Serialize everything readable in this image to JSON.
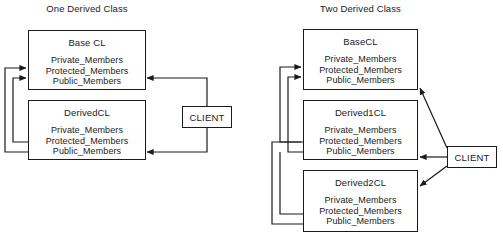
{
  "diagram": {
    "type": "uml-inheritance-diagram",
    "background_color": "#ffffff",
    "line_color": "#1a1a1a",
    "text_color": "#1a1a1a",
    "members": {
      "private": "Private_Members",
      "protected": "Protected_Members",
      "public": "Public_Members"
    },
    "panels": [
      {
        "id": "one-derived-class",
        "title": "One Derived Class",
        "classes": [
          {
            "id": "base-cl",
            "name": "Base CL",
            "members": [
              "Private_Members",
              "Protected_Members",
              "Public_Members"
            ]
          },
          {
            "id": "derived-cl",
            "name": "DerivedCL",
            "members": [
              "Private_Members",
              "Protected_Members",
              "Public_Members"
            ]
          }
        ],
        "actor": {
          "id": "client-left",
          "label": "CLIENT"
        }
      },
      {
        "id": "two-derived-class",
        "title": "Two Derived Class",
        "classes": [
          {
            "id": "base-cl-2",
            "name": "BaseCL",
            "members": [
              "Private_Members",
              "Protected_Members",
              "Public_Members"
            ]
          },
          {
            "id": "derived1-cl",
            "name": "Derived1CL",
            "members": [
              "Private_Members",
              "Protected_Members",
              "Public_Members"
            ]
          },
          {
            "id": "derived2-cl",
            "name": "Derived2CL",
            "members": [
              "Private_Members",
              "Protected_Members",
              "Public_Members"
            ]
          }
        ],
        "actor": {
          "id": "client-right",
          "label": "CLIENT"
        }
      }
    ]
  }
}
